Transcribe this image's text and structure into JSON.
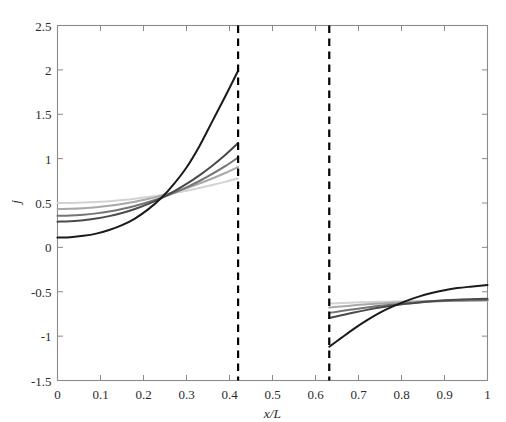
{
  "chart_data": {
    "type": "line",
    "title": "",
    "xlabel": "x/L",
    "ylabel": "j",
    "xlim": [
      0,
      1
    ],
    "ylim": [
      -1.5,
      2.5
    ],
    "xticks": [
      0,
      0.1,
      0.2,
      0.3,
      0.4,
      0.5,
      0.6,
      0.7,
      0.8,
      0.9,
      1
    ],
    "xtick_labels": [
      "0",
      "0.1",
      "0.2",
      "0.3",
      "0.4",
      "0.5",
      "0.6",
      "0.7",
      "0.8",
      "0.9",
      "1"
    ],
    "yticks": [
      -1.5,
      -1,
      -0.5,
      0,
      0.5,
      1,
      1.5,
      2,
      2.5
    ],
    "ytick_labels": [
      "-1.5",
      "-1",
      "-0.5",
      "0",
      "0.5",
      "1",
      "1.5",
      "2",
      "2.5"
    ],
    "grid": false,
    "legend": "none",
    "box": true,
    "annotations": [
      {
        "name": "left-gap-boundary",
        "type": "vline",
        "x": 0.42,
        "style": "dashed",
        "color": "#000000",
        "width": 2.2
      },
      {
        "name": "right-gap-boundary",
        "type": "vline",
        "x": 0.632,
        "style": "dashed",
        "color": "#000000",
        "width": 2.2
      }
    ],
    "segments": {
      "left": {
        "x_start": 0.0,
        "x_end": 0.42
      },
      "right": {
        "x_start": 0.632,
        "x_end": 1.0
      }
    },
    "series": [
      {
        "name": "curve-1-darkest",
        "color": "#1a1a1a",
        "width": 2.0,
        "left": {
          "x": [
            0.0,
            0.03,
            0.06,
            0.09,
            0.12,
            0.15,
            0.18,
            0.21,
            0.24,
            0.27,
            0.3,
            0.33,
            0.36,
            0.39,
            0.42
          ],
          "y": [
            0.11,
            0.115,
            0.13,
            0.155,
            0.195,
            0.25,
            0.325,
            0.425,
            0.55,
            0.71,
            0.9,
            1.14,
            1.42,
            1.7,
            1.99
          ]
        },
        "right": {
          "x": [
            0.632,
            0.66,
            0.69,
            0.72,
            0.75,
            0.78,
            0.81,
            0.84,
            0.87,
            0.9,
            0.93,
            0.96,
            1.0
          ],
          "y": [
            -1.12,
            -1.02,
            -0.915,
            -0.82,
            -0.735,
            -0.665,
            -0.605,
            -0.555,
            -0.515,
            -0.483,
            -0.459,
            -0.443,
            -0.425
          ]
        }
      },
      {
        "name": "curve-2",
        "color": "#4a4a4a",
        "width": 2.0,
        "left": {
          "x": [
            0.0,
            0.03,
            0.06,
            0.09,
            0.12,
            0.15,
            0.18,
            0.21,
            0.24,
            0.27,
            0.3,
            0.33,
            0.36,
            0.39,
            0.42
          ],
          "y": [
            0.29,
            0.295,
            0.305,
            0.325,
            0.352,
            0.388,
            0.432,
            0.487,
            0.552,
            0.628,
            0.715,
            0.812,
            0.92,
            1.04,
            1.175
          ]
        },
        "right": {
          "x": [
            0.632,
            0.66,
            0.69,
            0.72,
            0.75,
            0.78,
            0.81,
            0.84,
            0.87,
            0.9,
            0.93,
            0.96,
            1.0
          ],
          "y": [
            -0.795,
            -0.765,
            -0.733,
            -0.704,
            -0.678,
            -0.655,
            -0.636,
            -0.62,
            -0.607,
            -0.597,
            -0.59,
            -0.585,
            -0.58
          ]
        }
      },
      {
        "name": "curve-3",
        "color": "#757575",
        "width": 2.0,
        "left": {
          "x": [
            0.0,
            0.03,
            0.06,
            0.09,
            0.12,
            0.15,
            0.18,
            0.21,
            0.24,
            0.27,
            0.3,
            0.33,
            0.36,
            0.39,
            0.42
          ],
          "y": [
            0.355,
            0.358,
            0.368,
            0.383,
            0.404,
            0.432,
            0.466,
            0.508,
            0.556,
            0.612,
            0.676,
            0.748,
            0.828,
            0.916,
            1.012
          ]
        },
        "right": {
          "x": [
            0.632,
            0.66,
            0.69,
            0.72,
            0.75,
            0.78,
            0.81,
            0.84,
            0.87,
            0.9,
            0.93,
            0.96,
            1.0
          ],
          "y": [
            -0.738,
            -0.717,
            -0.696,
            -0.677,
            -0.659,
            -0.644,
            -0.631,
            -0.62,
            -0.611,
            -0.604,
            -0.599,
            -0.596,
            -0.593
          ]
        }
      },
      {
        "name": "curve-4",
        "color": "#a8a8a8",
        "width": 2.0,
        "left": {
          "x": [
            0.0,
            0.03,
            0.06,
            0.09,
            0.12,
            0.15,
            0.18,
            0.21,
            0.24,
            0.27,
            0.3,
            0.33,
            0.36,
            0.39,
            0.42
          ],
          "y": [
            0.432,
            0.434,
            0.441,
            0.452,
            0.468,
            0.489,
            0.514,
            0.545,
            0.58,
            0.621,
            0.667,
            0.719,
            0.776,
            0.838,
            0.906
          ]
        },
        "right": {
          "x": [
            0.632,
            0.66,
            0.69,
            0.72,
            0.75,
            0.78,
            0.81,
            0.84,
            0.87,
            0.9,
            0.93,
            0.96,
            1.0
          ],
          "y": [
            -0.678,
            -0.665,
            -0.653,
            -0.642,
            -0.632,
            -0.623,
            -0.616,
            -0.61,
            -0.605,
            -0.601,
            -0.599,
            -0.597,
            -0.596
          ]
        }
      },
      {
        "name": "curve-5-lightest",
        "color": "#d2d2d2",
        "width": 2.0,
        "left": {
          "x": [
            0.0,
            0.03,
            0.06,
            0.09,
            0.12,
            0.15,
            0.18,
            0.21,
            0.24,
            0.27,
            0.3,
            0.33,
            0.36,
            0.39,
            0.42
          ],
          "y": [
            0.5,
            0.501,
            0.505,
            0.512,
            0.521,
            0.534,
            0.549,
            0.567,
            0.588,
            0.612,
            0.639,
            0.669,
            0.702,
            0.738,
            0.777
          ]
        },
        "right": {
          "x": [
            0.632,
            0.66,
            0.69,
            0.72,
            0.75,
            0.78,
            0.81,
            0.84,
            0.87,
            0.9,
            0.93,
            0.96,
            1.0
          ],
          "y": [
            -0.632,
            -0.627,
            -0.622,
            -0.618,
            -0.614,
            -0.611,
            -0.608,
            -0.606,
            -0.604,
            -0.603,
            -0.602,
            -0.601,
            -0.601
          ]
        }
      }
    ]
  },
  "axes": {
    "box_color": "#8a8a8a",
    "tick_color": "#8a8a8a",
    "text_color": "#2b2b2b"
  }
}
